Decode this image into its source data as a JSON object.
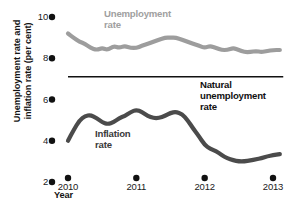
{
  "chart_data": {
    "type": "line",
    "title": "",
    "xlabel": "Year",
    "ylabel": "Unemployment rate and inflation rate (per cent)",
    "xlim": [
      2010,
      2013.2
    ],
    "ylim": [
      2,
      10
    ],
    "grid": false,
    "legend_position": "inline-annotations",
    "xticks": [
      "2010",
      "2011",
      "2012",
      "2013"
    ],
    "xtick_values": [
      2010,
      2011,
      2012,
      2013
    ],
    "yticks": [
      "10",
      "8",
      "6",
      "4",
      "2"
    ],
    "ytick_values": [
      10,
      8,
      6,
      4,
      2
    ],
    "series": [
      {
        "name": "Unemployment rate",
        "color": "#9d9d9d",
        "label_color": "#a0a0a0",
        "x": [
          2010.0,
          2010.08,
          2010.17,
          2010.25,
          2010.33,
          2010.42,
          2010.5,
          2010.58,
          2010.67,
          2010.75,
          2010.83,
          2010.92,
          2011.0,
          2011.08,
          2011.17,
          2011.25,
          2011.33,
          2011.42,
          2011.5,
          2011.58,
          2011.67,
          2011.75,
          2011.83,
          2011.92,
          2012.0,
          2012.08,
          2012.17,
          2012.25,
          2012.33,
          2012.42,
          2012.5,
          2012.58,
          2012.67,
          2012.75,
          2012.83,
          2012.92,
          2013.0,
          2013.1
        ],
        "values": [
          9.2,
          9.0,
          8.8,
          8.7,
          8.5,
          8.4,
          8.5,
          8.4,
          8.6,
          8.5,
          8.6,
          8.5,
          8.5,
          8.6,
          8.7,
          8.8,
          8.9,
          9.0,
          9.0,
          9.0,
          8.9,
          8.8,
          8.7,
          8.6,
          8.5,
          8.6,
          8.5,
          8.4,
          8.4,
          8.5,
          8.4,
          8.3,
          8.3,
          8.35,
          8.3,
          8.35,
          8.4,
          8.4
        ]
      },
      {
        "name": "Inflation rate",
        "color": "#4b4b4b",
        "label_color": "#3a3a3a",
        "x": [
          2010.0,
          2010.08,
          2010.17,
          2010.25,
          2010.33,
          2010.42,
          2010.5,
          2010.58,
          2010.67,
          2010.75,
          2010.83,
          2010.92,
          2011.0,
          2011.08,
          2011.17,
          2011.25,
          2011.33,
          2011.42,
          2011.5,
          2011.58,
          2011.67,
          2011.75,
          2011.83,
          2011.92,
          2012.0,
          2012.08,
          2012.17,
          2012.25,
          2012.33,
          2012.42,
          2012.5,
          2012.58,
          2012.67,
          2012.75,
          2012.83,
          2012.92,
          2013.0,
          2013.1
        ],
        "values": [
          4.0,
          4.5,
          5.0,
          5.2,
          5.25,
          5.1,
          4.9,
          4.8,
          4.9,
          5.1,
          5.2,
          5.4,
          5.5,
          5.4,
          5.2,
          5.1,
          5.1,
          5.2,
          5.35,
          5.4,
          5.3,
          5.0,
          4.6,
          4.2,
          3.8,
          3.6,
          3.5,
          3.3,
          3.15,
          3.05,
          3.0,
          3.0,
          3.05,
          3.1,
          3.15,
          3.25,
          3.3,
          3.35
        ]
      }
    ],
    "reference_lines": [
      {
        "name": "Natural unemployment rate",
        "value": 7.1,
        "color": "#111111",
        "x_start": 2010.0,
        "x_end": 2013.15
      }
    ],
    "annotations": [
      {
        "name": "unemployment-rate-label",
        "text_line1": "Unemployment",
        "text_line2": "rate"
      },
      {
        "name": "natural-rate-label",
        "text_line1": "Natural",
        "text_line2": "unemployment",
        "text_line3": "rate"
      },
      {
        "name": "inflation-rate-label",
        "text_line1": "Inflation",
        "text_line2": "rate"
      }
    ]
  },
  "axis": {
    "y_title": "Unemployment rate and inflation rate (per cent)",
    "y_title_line1": "Unemployment rate and",
    "y_title_line2": "inflation rate (per cent)",
    "x_title": "Year",
    "yticks": [
      "10",
      "8",
      "6",
      "4",
      "2"
    ],
    "xticks": [
      "2010",
      "2011",
      "2012",
      "2013"
    ]
  },
  "labels": {
    "unemployment_line1": "Unemployment",
    "unemployment_line2": "rate",
    "natural_line1": "Natural",
    "natural_line2": "unemployment",
    "natural_line3": "rate",
    "inflation_line1": "Inflation",
    "inflation_line2": "rate"
  }
}
